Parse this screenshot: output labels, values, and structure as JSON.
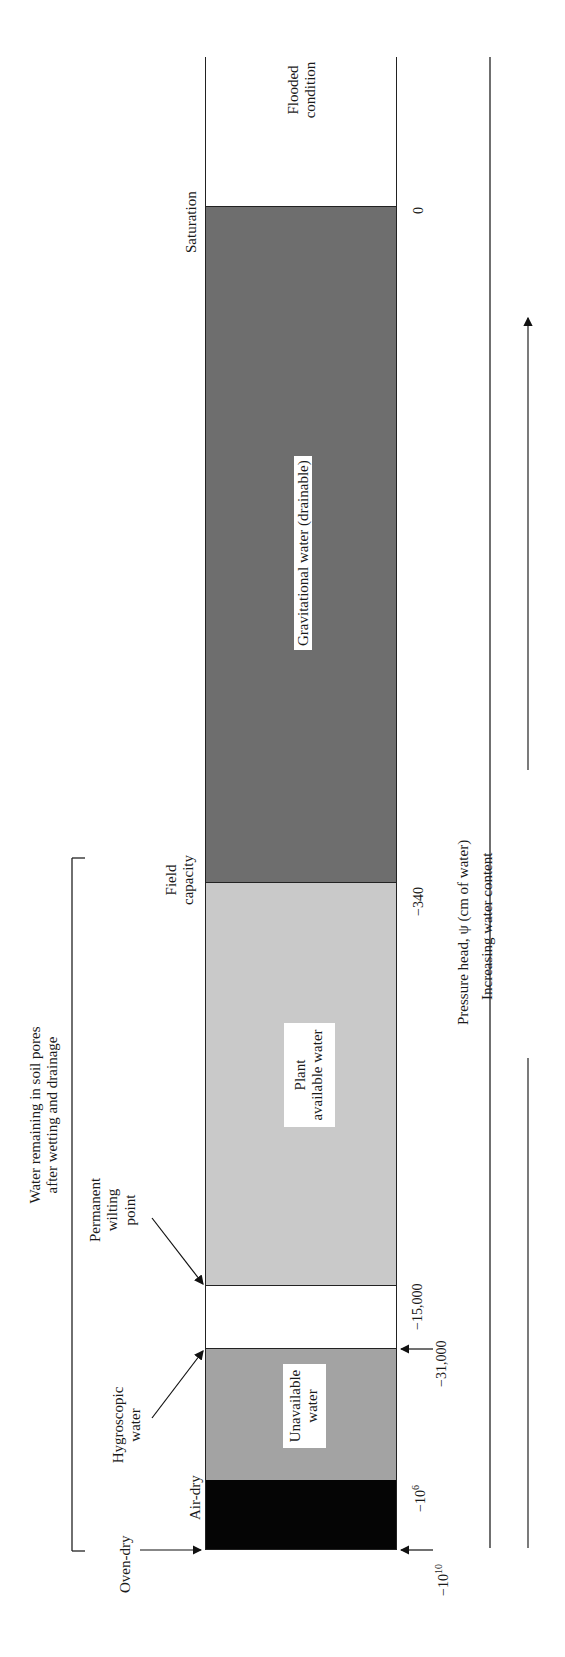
{
  "regions": [
    {
      "id": "flooded",
      "label_line1": "Flooded",
      "label_line2": "condition",
      "color": "#ffffff"
    },
    {
      "id": "gravitational",
      "label": "Gravitational water (drainable)",
      "color": "#6e6e6e"
    },
    {
      "id": "plant_available",
      "label_line1": "Plant",
      "label_line2": "available water",
      "color": "#c9c9c9"
    },
    {
      "id": "gap",
      "label": "",
      "color": "#ffffff"
    },
    {
      "id": "unavailable",
      "label_line1": "Unavailable",
      "label_line2": "water",
      "color": "#a3a3a3"
    },
    {
      "id": "oven_air_dry",
      "label": "",
      "color": "#050505"
    }
  ],
  "boundaries": {
    "saturation": "Saturation",
    "field_capacity_line1": "Field",
    "field_capacity_line2": "capacity",
    "permanent_wilting_line1": "Permanent",
    "permanent_wilting_line2": "wilting",
    "permanent_wilting_line3": "point",
    "hygroscopic_line1": "Hygroscopic",
    "hygroscopic_line2": "water",
    "air_dry": "Air-dry",
    "oven_dry": "Oven-dry"
  },
  "ticks": {
    "zero": "0",
    "fc": "−340",
    "pwp": "−15,000",
    "hyg": "−31,000",
    "airdry": "−10",
    "airdry_exp": "6",
    "ovendry": "−10",
    "ovendry_exp": "10"
  },
  "axis": {
    "label": "Pressure head, ψ (cm of water)",
    "direction": "Increasing water content"
  },
  "bracket": {
    "line1": "Water remaining in soil pores",
    "line2": "after wetting and drainage"
  }
}
